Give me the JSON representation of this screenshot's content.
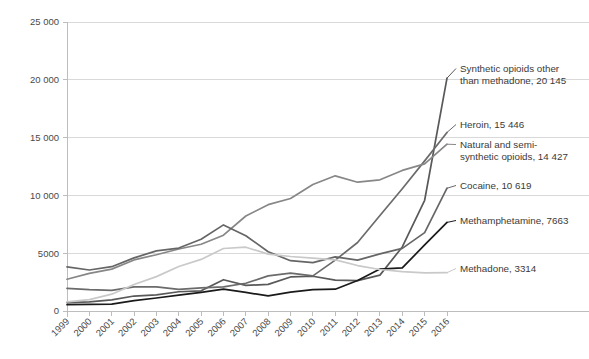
{
  "chart_data": {
    "type": "line",
    "title": "",
    "subtitle": "",
    "xlabel": "",
    "ylabel": "",
    "grid": true,
    "legend_position": "right-inline-labels",
    "xlim": [
      1999,
      2016
    ],
    "ylim": [
      0,
      25000
    ],
    "ytick_labels": [
      "25 000",
      "20 000",
      "15 000",
      "10 000",
      "5000",
      "0"
    ],
    "ytick_values": [
      25000,
      20000,
      15000,
      10000,
      5000,
      0
    ],
    "categories": [
      "1999",
      "2000",
      "2001",
      "2002",
      "2003",
      "2004",
      "2005",
      "2006",
      "2007",
      "2008",
      "2009",
      "2010",
      "2011",
      "2012",
      "2013",
      "2014",
      "2015",
      "2016"
    ],
    "series": [
      {
        "name": "Synthetic opioids other than methadone",
        "label": "Synthetic opioids other than methadone, 20 145",
        "end_value": 20145,
        "color": "#595959",
        "values": [
          730,
          782,
          957,
          1295,
          1400,
          1664,
          1742,
          2707,
          2213,
          2306,
          2946,
          3007,
          2666,
          2628,
          3105,
          5544,
          9580,
          20145
        ]
      },
      {
        "name": "Heroin",
        "label": "Heroin, 15 446",
        "end_value": 15446,
        "color": "#6b6b6b",
        "values": [
          1960,
          1842,
          1779,
          2089,
          2080,
          1878,
          2009,
          2088,
          2399,
          3041,
          3278,
          3036,
          4397,
          5925,
          8257,
          10574,
          12989,
          15446
        ]
      },
      {
        "name": "Natural and semi-synthetic opioids",
        "label": "Natural and semi-synthetic opioids, 14 427",
        "end_value": 14427,
        "color": "#878787",
        "values": [
          2749,
          3249,
          3620,
          4416,
          4867,
          5364,
          5774,
          6560,
          8218,
          9199,
          9733,
          10943,
          11693,
          11140,
          11346,
          12159,
          12727,
          14427
        ]
      },
      {
        "name": "Cocaine",
        "label": "Cocaine, 10 619",
        "end_value": 10619,
        "color": "#666666",
        "values": [
          3822,
          3544,
          3833,
          4599,
          5196,
          5443,
          6208,
          7448,
          6512,
          5129,
          4350,
          4183,
          4681,
          4404,
          4944,
          5415,
          6784,
          10619
        ]
      },
      {
        "name": "Methamphetamine",
        "label": "Methamphetamine, 7663",
        "end_value": 7663,
        "color": "#1a1a1a",
        "values": [
          547,
          573,
          599,
          903,
          1122,
          1371,
          1608,
          1887,
          1607,
          1304,
          1632,
          1854,
          1887,
          2635,
          3627,
          3728,
          5716,
          7663
        ]
      },
      {
        "name": "Methadone",
        "label": "Methadone, 3314",
        "end_value": 3314,
        "color": "#c9c9c9",
        "values": [
          784,
          988,
          1456,
          2292,
          2972,
          3849,
          4462,
          5406,
          5518,
          4924,
          4716,
          4577,
          4418,
          3932,
          3591,
          3400,
          3301,
          3314
        ]
      }
    ]
  }
}
